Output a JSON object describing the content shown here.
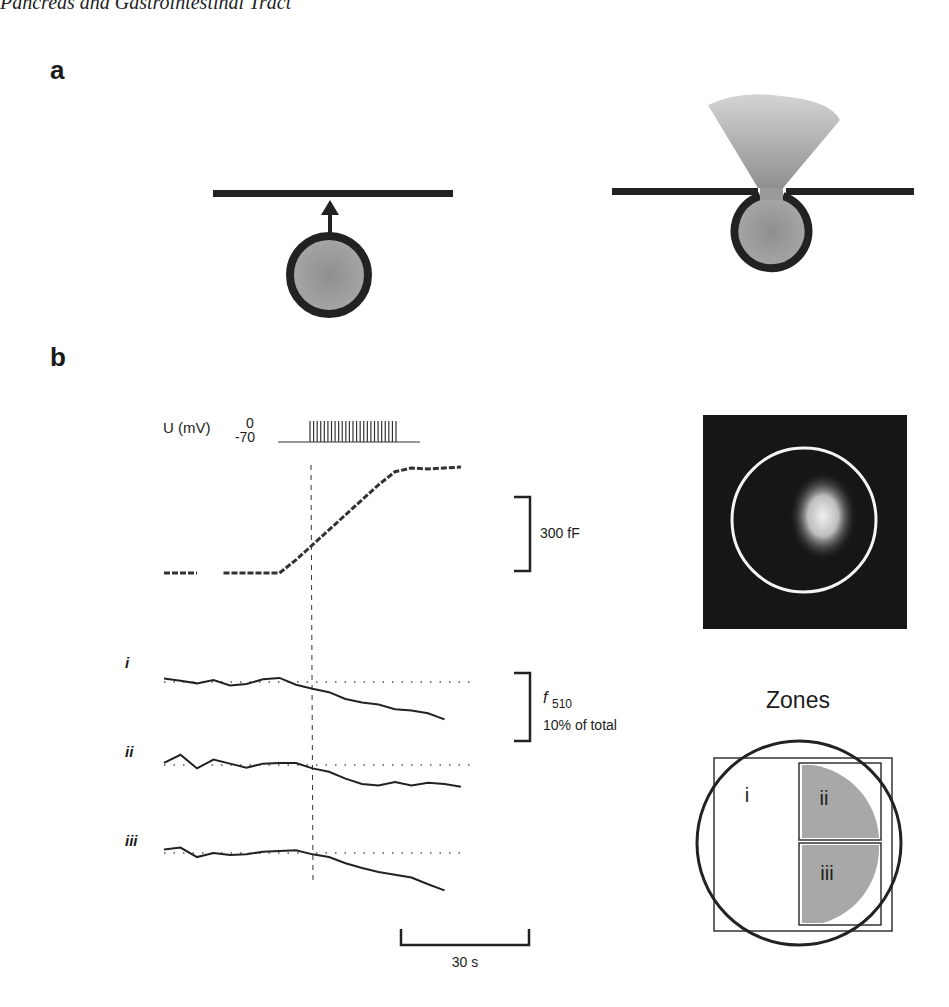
{
  "header": {
    "running_title": "Pancreas and Gastrointestinal Tract"
  },
  "panel_a": {
    "label": "a",
    "left_schematic": {
      "description": "vesicle approaching membrane",
      "icon": "arrow-up-icon"
    },
    "right_schematic": {
      "description": "vesicle fused with membrane releasing content"
    }
  },
  "panel_b": {
    "label": "b",
    "voltage": {
      "axis_label": "U (mV)",
      "tick_top": "0",
      "tick_bottom": "-70",
      "pulse_count": 25
    },
    "capacitance_scale": {
      "label": "300 fF"
    },
    "fluorescence_scale": {
      "symbol": "f",
      "subscript": "510",
      "label": "10% of total"
    },
    "time_scale": {
      "label": "30 s"
    },
    "trace_labels": [
      "i",
      "ii",
      "iii"
    ],
    "image_title": "Zones",
    "zone_labels": [
      "i",
      "ii",
      "iii"
    ]
  },
  "chart_data": {
    "type": "line",
    "title": "",
    "xlabel": "time (scale bar 30 s)",
    "ylabel": "",
    "stimulus_onset_marker": "dashed vertical line",
    "series": [
      {
        "name": "Capacitance",
        "unit": "fF (scale 300 fF)",
        "x": [
          0,
          5,
          10,
          15,
          20,
          25,
          30,
          35,
          40,
          45,
          50,
          55,
          60,
          65,
          70,
          75,
          80,
          85,
          90
        ],
        "values": [
          0,
          0,
          0,
          0,
          0,
          0,
          0,
          0,
          70,
          150,
          230,
          310,
          390,
          470,
          540,
          560,
          555,
          560,
          565
        ]
      },
      {
        "name": "i",
        "unit": "f510 (% of total, scale 10%)",
        "x": [
          0,
          5,
          10,
          15,
          20,
          25,
          30,
          35,
          40,
          45,
          50,
          55,
          60,
          65,
          70,
          75,
          80,
          85
        ],
        "values": [
          0.5,
          0.2,
          -0.2,
          0.3,
          -0.5,
          -0.3,
          0.4,
          0.6,
          -0.4,
          -1.0,
          -1.5,
          -2.5,
          -3.0,
          -3.3,
          -4.0,
          -4.2,
          -4.6,
          -5.5
        ]
      },
      {
        "name": "ii",
        "unit": "f510 (% of total)",
        "x": [
          0,
          5,
          10,
          15,
          20,
          25,
          30,
          35,
          40,
          45,
          50,
          55,
          60,
          65,
          70,
          75,
          80,
          85,
          90
        ],
        "values": [
          0.3,
          1.5,
          -0.5,
          0.8,
          0.2,
          -0.4,
          0.2,
          0.3,
          0.3,
          -0.5,
          -1.0,
          -2.0,
          -2.8,
          -3.0,
          -2.5,
          -3.0,
          -2.6,
          -2.8,
          -3.2
        ]
      },
      {
        "name": "iii",
        "unit": "f510 (% of total)",
        "x": [
          0,
          5,
          10,
          15,
          20,
          25,
          30,
          35,
          40,
          45,
          50,
          55,
          60,
          65,
          70,
          75,
          80,
          85
        ],
        "values": [
          0.5,
          0.8,
          -0.6,
          0.0,
          -0.3,
          -0.2,
          0.2,
          0.3,
          0.4,
          -0.2,
          -0.6,
          -1.5,
          -2.2,
          -2.8,
          -3.2,
          -3.6,
          -4.6,
          -5.5
        ]
      }
    ]
  }
}
